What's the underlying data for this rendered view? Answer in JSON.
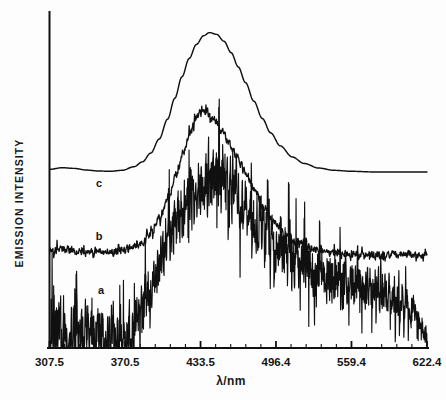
{
  "figure": {
    "background_color": "#fdfdfd",
    "ink_color": "#101010"
  },
  "axes": {
    "x_label": "λ/nm",
    "y_label": "EMISSION INTENSITY",
    "x_tick_labels": [
      "307.5",
      "370.5",
      "433.5",
      "496.4",
      "559.4",
      "622.4"
    ],
    "x_tick_values": [
      307.5,
      370.5,
      433.5,
      496.4,
      559.4,
      622.4
    ]
  },
  "curve_labels": [
    {
      "name": "c",
      "text": "c"
    },
    {
      "name": "b",
      "text": "b"
    },
    {
      "name": "a",
      "text": "a"
    }
  ],
  "chart_data": {
    "type": "line",
    "title": "",
    "subtitle": "",
    "xlabel": "λ/nm",
    "ylabel": "EMISSION INTENSITY",
    "xlim": [
      307.5,
      622.4
    ],
    "ylim": [
      0,
      1
    ],
    "grid": false,
    "legend": "inline-curve-labels",
    "annotations": [
      {
        "text": "c",
        "x": 355,
        "y": 0.62,
        "note": "label for smooth top trace"
      },
      {
        "text": "b",
        "x": 358,
        "y": 0.44,
        "note": "label for middle slightly noisy trace"
      },
      {
        "text": "a",
        "x": 360,
        "y": 0.22,
        "note": "label for bottom very noisy trace"
      }
    ],
    "x_tick_labels": [
      "307.5",
      "370.5",
      "433.5",
      "496.4",
      "559.4",
      "622.4"
    ],
    "x_ticks": [
      307.5,
      370.5,
      433.5,
      496.4,
      559.4,
      622.4
    ],
    "series": [
      {
        "name": "c",
        "label": "c",
        "style": "smooth",
        "noise_amplitude": 0.0,
        "baseline": 0.535,
        "peak_x": 441.0,
        "peak_y": 0.9675,
        "peak_width_nm": 58,
        "x": [
          307.5,
          318.0,
          328.0,
          338.0,
          348.0,
          358.0,
          368.0,
          378.0,
          385.0,
          392.0,
          399.0,
          406.0,
          412.0,
          418.0,
          424.0,
          430.0,
          436.0,
          441.0,
          447.0,
          453.0,
          459.0,
          465.0,
          471.0,
          478.0,
          485.0,
          492.0,
          500.0,
          510.0,
          520.0,
          532.0,
          545.0,
          560.0,
          578.0,
          598.0,
          622.4
        ],
        "y": [
          0.548,
          0.553,
          0.551,
          0.546,
          0.543,
          0.542,
          0.545,
          0.556,
          0.571,
          0.598,
          0.641,
          0.702,
          0.766,
          0.832,
          0.888,
          0.931,
          0.958,
          0.9675,
          0.962,
          0.941,
          0.906,
          0.862,
          0.814,
          0.757,
          0.704,
          0.66,
          0.62,
          0.586,
          0.566,
          0.552,
          0.545,
          0.542,
          0.54,
          0.54,
          0.54
        ]
      },
      {
        "name": "b",
        "label": "b",
        "style": "slightly-noisy",
        "noise_amplitude": 0.012,
        "baseline": 0.302,
        "peak_x": 434.0,
        "peak_y": 0.728,
        "peak_width_nm": 60,
        "x": [
          307.5,
          318.0,
          328.0,
          338.0,
          348.0,
          358.0,
          368.0,
          378.0,
          386.0,
          393.0,
          400.0,
          407.0,
          413.0,
          419.0,
          425.0,
          430.0,
          434.0,
          439.0,
          445.0,
          451.0,
          457.0,
          464.0,
          471.0,
          478.0,
          486.0,
          494.0,
          503.0,
          513.0,
          524.0,
          537.0,
          551.0,
          568.0,
          588.0,
          605.0,
          622.4
        ],
        "y": [
          0.298,
          0.302,
          0.3,
          0.297,
          0.296,
          0.297,
          0.3,
          0.31,
          0.326,
          0.357,
          0.404,
          0.466,
          0.531,
          0.6,
          0.662,
          0.706,
          0.728,
          0.722,
          0.699,
          0.668,
          0.631,
          0.585,
          0.537,
          0.488,
          0.436,
          0.391,
          0.352,
          0.325,
          0.308,
          0.297,
          0.291,
          0.288,
          0.286,
          0.286,
          0.287
        ]
      },
      {
        "name": "a",
        "label": "a",
        "style": "very-noisy",
        "noise_amplitude": 0.075,
        "baseline": 0.0,
        "peak_x": 444.0,
        "peak_y": 0.513,
        "peak_width_nm": 75,
        "x": [
          307.5,
          318.0,
          328.0,
          338.0,
          348.0,
          358.0,
          368.0,
          376.0,
          383.0,
          390.0,
          397.0,
          404.0,
          411.0,
          418.0,
          425.0,
          432.0,
          438.0,
          444.0,
          450.0,
          457.0,
          464.0,
          471.0,
          479.0,
          487.0,
          496.0,
          506.0,
          517.0,
          529.0,
          542.0,
          556.0,
          572.0,
          588.0,
          603.0,
          614.0,
          622.4
        ],
        "y": [
          0.052,
          0.055,
          0.05,
          0.046,
          0.048,
          0.044,
          0.04,
          0.048,
          0.085,
          0.152,
          0.232,
          0.305,
          0.367,
          0.42,
          0.46,
          0.489,
          0.504,
          0.513,
          0.505,
          0.486,
          0.46,
          0.43,
          0.396,
          0.36,
          0.322,
          0.287,
          0.256,
          0.232,
          0.213,
          0.199,
          0.186,
          0.172,
          0.15,
          0.105,
          0.03
        ]
      }
    ]
  }
}
